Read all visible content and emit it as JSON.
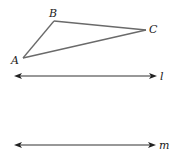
{
  "diagram": {
    "triangle": {
      "vertices": [
        {
          "name": "A",
          "x": 23,
          "y": 58,
          "label_x": 11,
          "label_y": 64
        },
        {
          "name": "B",
          "x": 54,
          "y": 21,
          "label_x": 49,
          "label_y": 17
        },
        {
          "name": "C",
          "x": 146,
          "y": 30,
          "label_x": 149,
          "label_y": 33
        }
      ],
      "edge_color": "#6a6a6a"
    },
    "lines": [
      {
        "name": "l",
        "y": 76,
        "x1": 14,
        "x2": 157,
        "label": "l",
        "label_x": 160,
        "label_y": 80
      },
      {
        "name": "m",
        "y": 145,
        "x1": 14,
        "x2": 156,
        "label": "m",
        "label_x": 159,
        "label_y": 149
      }
    ],
    "line_color": "#333333"
  }
}
